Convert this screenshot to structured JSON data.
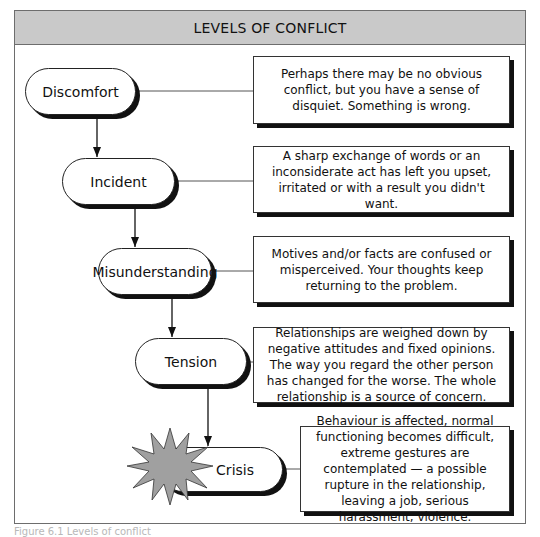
{
  "title": "LEVELS OF CONFLICT",
  "levels": [
    {
      "label": "Discomfort",
      "description": "Perhaps there may be no obvious conflict, but you have a sense of disquiet. Something is wrong."
    },
    {
      "label": "Incident",
      "description": "A sharp exchange of words or an inconsiderate act has left you upset, irritated or with a result you didn't want."
    },
    {
      "label": "Misunderstanding",
      "description": "Motives and/or facts are confused or misperceived. Your thoughts keep returning to the problem."
    },
    {
      "label": "Tension",
      "description": "Relationships are weighed down by negative attitudes and fixed opinions. The way you regard the other person has changed for the worse. The whole relationship is a source of concern."
    },
    {
      "label": "Crisis",
      "description": "Behaviour is affected, normal functioning becomes difficult, extreme gestures are contemplated — a possible rupture in the relationship, leaving a job, serious harassment, violence."
    }
  ],
  "caption": "Figure 6.1 Levels of conflict",
  "colors": {
    "header_bg": "#c9c9c9",
    "starburst": "#a0a0a0",
    "shadow": "#111111"
  }
}
